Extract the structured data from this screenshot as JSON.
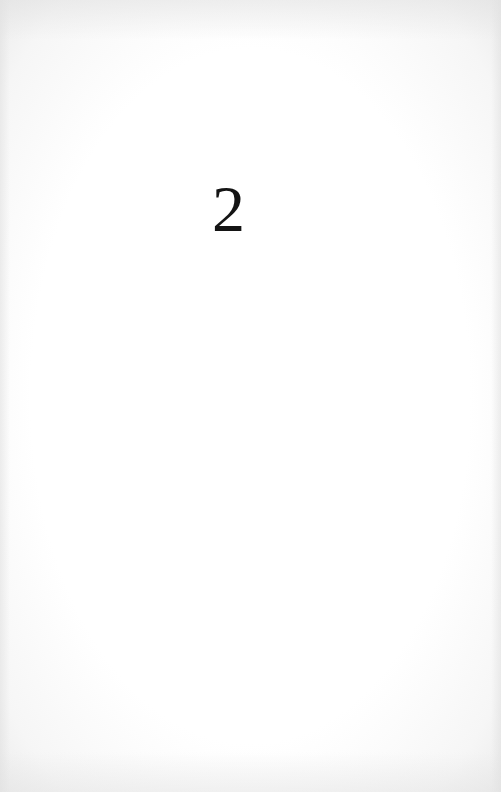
{
  "page": {
    "chapter_number": "2",
    "background_color": "#ffffff",
    "text_color": "#141414"
  }
}
